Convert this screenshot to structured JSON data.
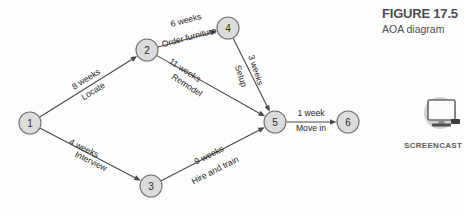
{
  "figure": {
    "number_label": "FIGURE 17.5",
    "caption": "AOA diagram"
  },
  "screencast": {
    "label": "SCREENCAST",
    "icon": "monitor-icon"
  },
  "colors": {
    "node_fill": "#dcdcdc",
    "node_stroke": "#6f6f6f",
    "edge": "#4a4a4a",
    "text": "#1f1f1f",
    "caption_text": "#4d4d4d",
    "badge_circle": "#d0d0d0",
    "background": "#fdfdfd"
  },
  "chart_data": {
    "type": "diagram",
    "diagram_kind": "AOA activity-on-arrow network",
    "title": "FIGURE 17.5",
    "subtitle": "AOA diagram",
    "nodes": [
      {
        "id": "1",
        "label": "1",
        "x": 30,
        "y": 123,
        "r": 11
      },
      {
        "id": "2",
        "label": "2",
        "x": 147,
        "y": 50,
        "r": 11
      },
      {
        "id": "3",
        "label": "3",
        "x": 151,
        "y": 186,
        "r": 11
      },
      {
        "id": "4",
        "label": "4",
        "x": 228,
        "y": 28,
        "r": 11
      },
      {
        "id": "5",
        "label": "5",
        "x": 275,
        "y": 122,
        "r": 11
      },
      {
        "id": "6",
        "label": "6",
        "x": 348,
        "y": 122,
        "r": 11
      }
    ],
    "edges": [
      {
        "id": "e1",
        "from": "1",
        "to": "2",
        "duration": "8 weeks",
        "activity": "Locate",
        "duration_x": 86,
        "duration_y": 79,
        "activity_x": 93,
        "activity_y": 91,
        "rotation": -32
      },
      {
        "id": "e2",
        "from": "2",
        "to": "4",
        "duration": "6 weeks",
        "activity": "Order furniture",
        "duration_x": 186,
        "duration_y": 20,
        "activity_x": 189,
        "activity_y": 37,
        "rotation": -15
      },
      {
        "id": "e3",
        "from": "2",
        "to": "5",
        "duration": "11 weeks",
        "activity": "Remodel",
        "duration_x": 185,
        "duration_y": 70,
        "activity_x": 187,
        "activity_y": 85,
        "rotation": 33
      },
      {
        "id": "e4",
        "from": "4",
        "to": "5",
        "duration": "3 weeks",
        "activity": "Setup",
        "duration_x": 256,
        "duration_y": 70,
        "activity_x": 241,
        "activity_y": 76,
        "rotation": 72
      },
      {
        "id": "e5",
        "from": "1",
        "to": "3",
        "duration": "4 weeks",
        "activity": "Interview",
        "duration_x": 84,
        "duration_y": 148,
        "activity_x": 91,
        "activity_y": 161,
        "rotation": 26
      },
      {
        "id": "e6",
        "from": "3",
        "to": "5",
        "duration": "9 weeks",
        "activity": "Hire and train",
        "duration_x": 209,
        "duration_y": 155,
        "activity_x": 215,
        "activity_y": 170,
        "rotation": -27
      },
      {
        "id": "e7",
        "from": "5",
        "to": "6",
        "duration": "1 week",
        "activity": "Move in",
        "duration_x": 311,
        "duration_y": 113,
        "activity_x": 311,
        "activity_y": 128,
        "rotation": 0
      }
    ]
  }
}
